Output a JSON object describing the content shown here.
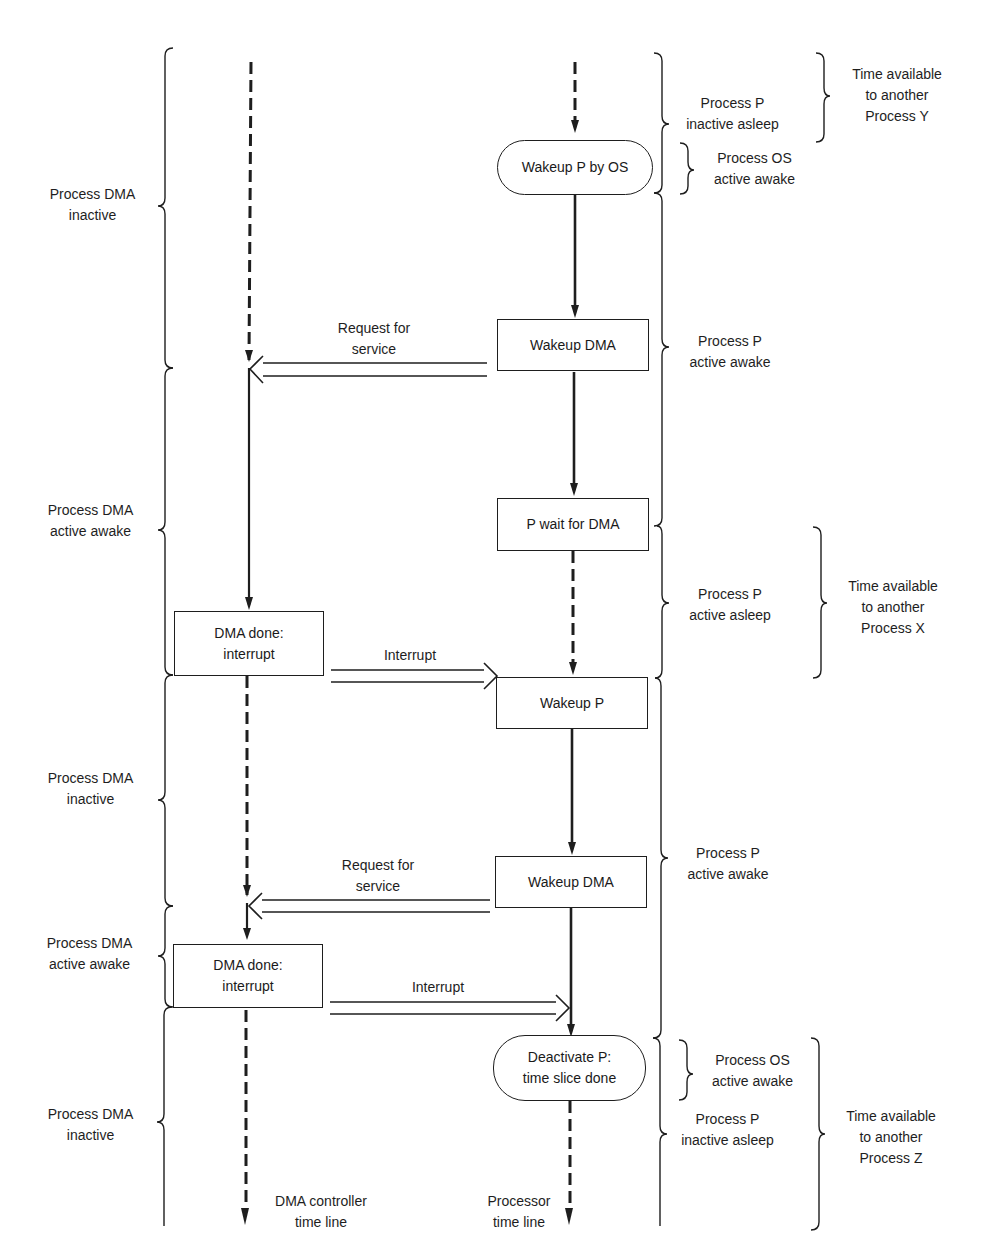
{
  "timelines": {
    "dma": {
      "label_line1": "DMA controller",
      "label_line2": "time line"
    },
    "processor": {
      "label_line1": "Processor",
      "label_line2": "time line"
    }
  },
  "processor_steps": [
    {
      "id": "wakeup-p-by-os",
      "shape": "rounded",
      "line1": "Wakeup P by OS",
      "line2": ""
    },
    {
      "id": "wakeup-dma-1",
      "shape": "box",
      "line1": "Wakeup DMA",
      "line2": ""
    },
    {
      "id": "p-wait-for-dma",
      "shape": "box",
      "line1": "P wait for DMA",
      "line2": ""
    },
    {
      "id": "wakeup-p",
      "shape": "box",
      "line1": "Wakeup P",
      "line2": ""
    },
    {
      "id": "wakeup-dma-2",
      "shape": "box",
      "line1": "Wakeup DMA",
      "line2": ""
    },
    {
      "id": "deactivate-p",
      "shape": "rounded",
      "line1": "Deactivate P:",
      "line2": "time slice done"
    }
  ],
  "dma_steps": [
    {
      "id": "dma-done-1",
      "line1": "DMA done:",
      "line2": "interrupt"
    },
    {
      "id": "dma-done-2",
      "line1": "DMA done:",
      "line2": "interrupt"
    }
  ],
  "messages": [
    {
      "id": "request-1",
      "line1": "Request for",
      "line2": "service",
      "direction": "processor-to-dma"
    },
    {
      "id": "interrupt-1",
      "line1": "Interrupt",
      "line2": "",
      "direction": "dma-to-processor"
    },
    {
      "id": "request-2",
      "line1": "Request for",
      "line2": "service",
      "direction": "processor-to-dma"
    },
    {
      "id": "interrupt-2",
      "line1": "Interrupt",
      "line2": "",
      "direction": "dma-to-processor"
    }
  ],
  "dma_states": [
    {
      "line1": "Process DMA",
      "line2": "inactive"
    },
    {
      "line1": "Process DMA",
      "line2": "active awake"
    },
    {
      "line1": "Process DMA",
      "line2": "inactive"
    },
    {
      "line1": "Process DMA",
      "line2": "active awake"
    },
    {
      "line1": "Process DMA",
      "line2": "inactive"
    }
  ],
  "processor_states": [
    {
      "line1": "Process P",
      "line2": "inactive asleep"
    },
    {
      "line1": "Process OS",
      "line2": "active awake"
    },
    {
      "line1": "Process P",
      "line2": "active awake"
    },
    {
      "line1": "Process P",
      "line2": "active asleep"
    },
    {
      "line1": "Process P",
      "line2": "active awake"
    },
    {
      "line1": "Process OS",
      "line2": "active awake"
    },
    {
      "line1": "Process P",
      "line2": "inactive asleep"
    }
  ],
  "time_available": [
    {
      "line1": "Time available",
      "line2": "to another",
      "line3": "Process Y"
    },
    {
      "line1": "Time available",
      "line2": "to another",
      "line3": "Process X"
    },
    {
      "line1": "Time available",
      "line2": "to another",
      "line3": "Process Z"
    }
  ]
}
